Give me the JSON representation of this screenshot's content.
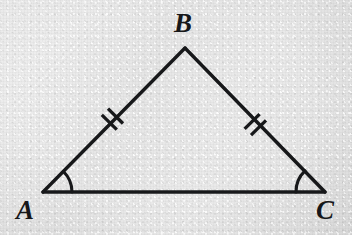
{
  "figure": {
    "kind": "geometry-diagram",
    "shape": "isosceles-triangle",
    "background_color": "#e8e8e8",
    "ink_color": "#17181a",
    "labels": {
      "a": "A",
      "b": "B",
      "c": "C"
    },
    "vertices": {
      "A": {
        "x": 43,
        "y": 192
      },
      "B": {
        "x": 185,
        "y": 48
      },
      "C": {
        "x": 325,
        "y": 192
      }
    },
    "sides": [
      {
        "name": "AB",
        "from": "A",
        "to": "B",
        "tick_marks": 2
      },
      {
        "name": "BC",
        "from": "B",
        "to": "C",
        "tick_marks": 2
      },
      {
        "name": "AC",
        "from": "A",
        "to": "C",
        "tick_marks": 0
      }
    ],
    "angle_arcs": [
      {
        "at": "A",
        "radius": 29,
        "arcs": 1
      },
      {
        "at": "C",
        "radius": 29,
        "arcs": 1
      }
    ],
    "tick_groups": [
      {
        "side": "AB",
        "center_x": 113,
        "center_y": 121,
        "count": 2
      },
      {
        "side": "BC",
        "center_x": 256,
        "center_y": 121,
        "count": 2
      }
    ],
    "stroke_width": 3.4
  }
}
